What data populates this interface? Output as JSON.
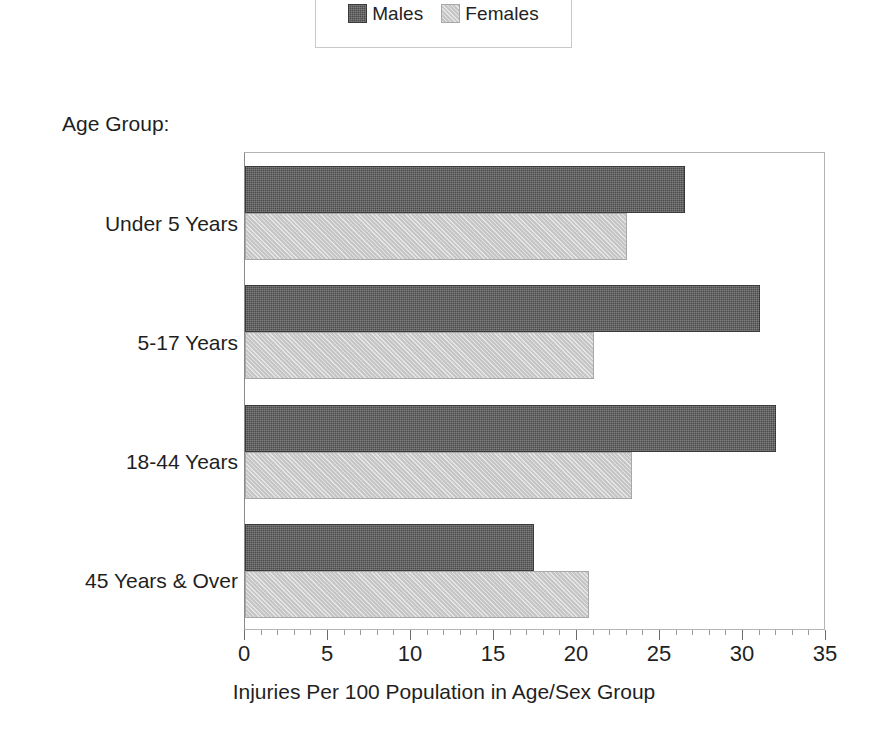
{
  "legend": {
    "entries": [
      {
        "label": "Males",
        "swatch": "legend-swatch-males",
        "color": "#4b4b4b"
      },
      {
        "label": "Females",
        "swatch": "legend-swatch-females",
        "color": "#c6c6c6"
      }
    ]
  },
  "captions": {
    "age_group": "Age Group:"
  },
  "chart_data": {
    "type": "bar",
    "orientation": "horizontal",
    "title": "",
    "subtitle": "",
    "xlabel": "Injuries Per 100 Population in Age/Sex Group",
    "ylabel": "Age Group:",
    "categories": [
      "Under 5 Years",
      "5-17 Years",
      "18-44 Years",
      "45 Years & Over"
    ],
    "series": [
      {
        "name": "Males",
        "color": "#4b4b4b",
        "values": [
          26.5,
          31.0,
          32.0,
          17.4
        ]
      },
      {
        "name": "Females",
        "color": "#c6c6c6",
        "values": [
          23.0,
          21.0,
          23.3,
          20.7
        ]
      }
    ],
    "xlim": [
      0,
      35
    ],
    "xticks": [
      0,
      5,
      10,
      15,
      20,
      25,
      30,
      35
    ],
    "xtick_labels": [
      "0",
      "5",
      "10",
      "15",
      "20",
      "25",
      "30",
      "35"
    ],
    "minor_tick_step": 1,
    "grid": false,
    "legend_position": "top-center"
  }
}
